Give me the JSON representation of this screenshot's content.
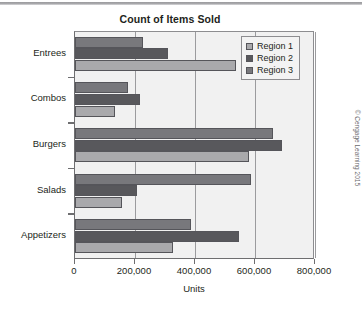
{
  "chart_data": {
    "type": "bar",
    "orientation": "horizontal",
    "title": "Count of Items Sold",
    "xlabel": "Units",
    "ylabel": "",
    "xlim": [
      0,
      800000
    ],
    "xticks": [
      0,
      200000,
      400000,
      600000,
      800000
    ],
    "xticklabels": [
      "0",
      "200,000",
      "400,000",
      "600,000",
      "800,000"
    ],
    "grid": "vertical",
    "legend_position": "top-right",
    "categories": [
      "Appetizers",
      "Salads",
      "Burgers",
      "Combos",
      "Entrees"
    ],
    "series": [
      {
        "name": "Region 1",
        "color": "#a9a9ac",
        "values": [
          325000,
          155000,
          580000,
          133000,
          535000
        ]
      },
      {
        "name": "Region 2",
        "color": "#58585c",
        "values": [
          545000,
          205000,
          690000,
          218000,
          310000
        ]
      },
      {
        "name": "Region 3",
        "color": "#78787c",
        "values": [
          385000,
          585000,
          660000,
          175000,
          225000
        ]
      }
    ]
  },
  "credit": "© Cengage Learning 2015"
}
